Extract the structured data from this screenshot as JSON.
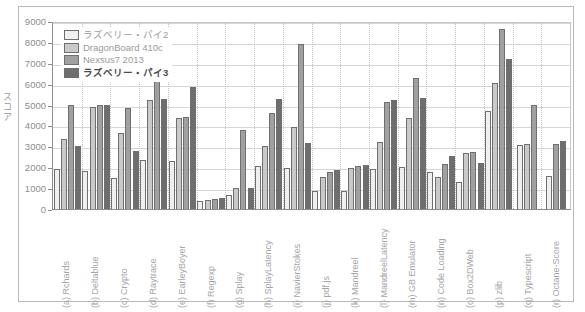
{
  "chart_data": {
    "type": "bar",
    "title": "",
    "xlabel": "",
    "ylabel": "スコア",
    "ylim": [
      0,
      9000
    ],
    "ytick_step": 1000,
    "yticks": [
      "0",
      "1000",
      "2000",
      "3000",
      "4000",
      "5000",
      "6000",
      "7000",
      "8000",
      "9000"
    ],
    "grid": true,
    "legend_position": "top-left",
    "categories": [
      "(a) Rchards",
      "(b) Deltablue",
      "(c) Crypto",
      "(d) Raytrace",
      "(e) EarleyBoyer",
      "(f) Regexp",
      "(g) Splay",
      "(h) SplayLatency",
      "(i) NavierStokes",
      "(j) pdf.js",
      "(k) Mandreel",
      "(l) MandreelLatency",
      "(m) GB Emulator",
      "(n) Code Loading",
      "(o) Box2DWeb",
      "(p) zlib",
      "(q) Typescript",
      "(r) Octane-Score"
    ],
    "category_letters": [
      "a",
      "b",
      "c",
      "d",
      "e",
      "f",
      "g",
      "h",
      "i",
      "j",
      "k",
      "l",
      "m",
      "n",
      "o",
      "p",
      "q",
      "r"
    ],
    "category_names": [
      "Rchards",
      "Deltablue",
      "Crypto",
      "Raytrace",
      "EarleyBoyer",
      "Regexp",
      "Splay",
      "SplayLatency",
      "NavierStokes",
      "pdf.js",
      "Mandreel",
      "MandreelLatency",
      "GB Emulator",
      "Code Loading",
      "Box2DWeb",
      "zlib",
      "Typescript",
      "Octane-Score"
    ],
    "series": [
      {
        "name": "ラズベリー・パイ2",
        "color": "#efefef",
        "values": [
          1900,
          1800,
          1500,
          2350,
          2300,
          370,
          650,
          2050,
          1980,
          850,
          840,
          1900,
          2000,
          1780,
          1280,
          4700,
          3050,
          1600
        ]
      },
      {
        "name": "DragonBoard 410c",
        "color": "#c9c9c9",
        "values": [
          3350,
          4880,
          3650,
          5200,
          4350,
          430,
          1000,
          3000,
          3930,
          1550,
          1980,
          3200,
          4350,
          1530,
          2680,
          6050,
          3100,
          null
        ]
      },
      {
        "name": "Nexsus7 2013",
        "color": "#a0a0a0",
        "values": [
          5000,
          5000,
          4850,
          6150,
          4400,
          470,
          3800,
          4600,
          7880,
          1790,
          2070,
          5100,
          6250,
          2150,
          2750,
          8600,
          5000,
          3100
        ]
      },
      {
        "name": "ラズベリー・パイ3",
        "color": "#6e6e6e",
        "values": [
          3020,
          5000,
          2780,
          5250,
          5850,
          510,
          1010,
          5250,
          3180,
          1880,
          2100,
          5200,
          5300,
          2550,
          2200,
          7200,
          null,
          3250
        ]
      }
    ]
  },
  "legend": {
    "items": [
      {
        "label": "ラズベリー・パイ2",
        "style": "s0"
      },
      {
        "label": "DragonBoard 410c",
        "style": "s1"
      },
      {
        "label": "Nexsus7 2013",
        "style": "s2"
      },
      {
        "label": "ラズベリー・パイ3",
        "style": "s3"
      }
    ]
  }
}
